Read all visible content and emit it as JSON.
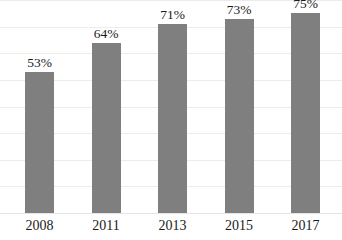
{
  "chart_data": {
    "type": "bar",
    "title": "",
    "subtitle": "",
    "xlabel": "",
    "ylabel": "",
    "categories": [
      "2008",
      "2011",
      "2013",
      "2015",
      "2017"
    ],
    "values": [
      53,
      64,
      71,
      73,
      75
    ],
    "data_labels": [
      "53%",
      "64%",
      "71%",
      "73%",
      "75%"
    ],
    "unit": "%",
    "ylim": [
      0,
      80
    ],
    "grid": true,
    "gridline_values": [
      10,
      20,
      30,
      40,
      50,
      60,
      70,
      80
    ],
    "legend": false,
    "legend_position": "none",
    "series": [
      {
        "name": "",
        "color": "#7f7f7f",
        "values": [
          53,
          64,
          71,
          73,
          75
        ]
      }
    ]
  },
  "style": {
    "bar_color": "#7f7f7f",
    "gridline_color": "#ececed",
    "baseline_color": "#e4e4e5",
    "background_color": "#ffffff",
    "text_color": "#1a1a1a"
  },
  "bars": [
    {
      "category": "2008",
      "value": 53,
      "label": "53%"
    },
    {
      "category": "2011",
      "value": 64,
      "label": "64%"
    },
    {
      "category": "2013",
      "value": 71,
      "label": "71%"
    },
    {
      "category": "2015",
      "value": 73,
      "label": "73%"
    },
    {
      "category": "2017",
      "value": 75,
      "label": "75%"
    }
  ]
}
